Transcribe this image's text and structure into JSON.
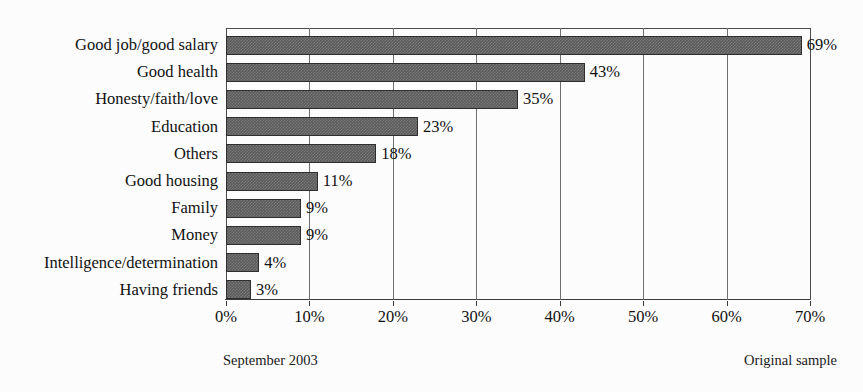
{
  "chart_data": {
    "type": "bar",
    "orientation": "horizontal",
    "title": "",
    "xlabel": "",
    "ylabel": "",
    "xlim": [
      0,
      70
    ],
    "xtick_labels": [
      "0%",
      "10%",
      "20%",
      "30%",
      "40%",
      "50%",
      "60%",
      "70%"
    ],
    "xticks": [
      0,
      10,
      20,
      30,
      40,
      50,
      60,
      70
    ],
    "grid": true,
    "legend": false,
    "categories": [
      "Good job/good salary",
      "Good health",
      "Honesty/faith/love",
      "Education",
      "Others",
      "Good housing",
      "Family",
      "Money",
      "Intelligence/determination",
      "Having friends"
    ],
    "values": [
      69,
      43,
      35,
      23,
      18,
      11,
      9,
      9,
      4,
      3
    ],
    "value_labels": [
      "69%",
      "43%",
      "35%",
      "23%",
      "18%",
      "11%",
      "9%",
      "9%",
      "4%",
      "3%"
    ],
    "bar_color": "#5b5b5b",
    "bar_edge_color": "#2e2e2e",
    "gridline_color": "#6f6f6f",
    "background_color": "#fcfcfc"
  },
  "footer": {
    "left": "September 2003",
    "right": "Original sample"
  }
}
